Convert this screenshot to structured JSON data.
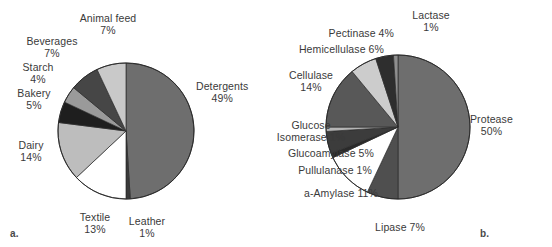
{
  "figure": {
    "background_color": "#ffffff",
    "text_color": "#3a3a3a",
    "panel_a_tag": "a.",
    "panel_b_tag": "b."
  },
  "chart_data": [
    {
      "type": "pie",
      "id": "industrial-enzyme-markets",
      "title": "",
      "panel_label": "a.",
      "units": "percent",
      "start_angle_deg": 0,
      "direction": "clockwise",
      "categories": [
        "Detergents",
        "Leather",
        "Textile",
        "Dairy",
        "Bakery",
        "Starch",
        "Beverages",
        "Animal feed"
      ],
      "values": [
        49,
        1,
        13,
        14,
        5,
        4,
        7,
        7
      ],
      "labels": [
        {
          "name": "Detergents",
          "pct": "49%",
          "value": 49,
          "fill": "#6e6e6e"
        },
        {
          "name": "Leather",
          "pct": "1%",
          "value": 1,
          "fill": "#3a3a3a"
        },
        {
          "name": "Textile",
          "pct": "13%",
          "value": 13,
          "fill": "#ffffff"
        },
        {
          "name": "Dairy",
          "pct": "14%",
          "value": 14,
          "fill": "#bdbdbd"
        },
        {
          "name": "Bakery",
          "pct": "5%",
          "value": 5,
          "fill": "#1e1e1e"
        },
        {
          "name": "Starch",
          "pct": "4%",
          "value": 4,
          "fill": "#9a9a9a"
        },
        {
          "name": "Beverages",
          "pct": "7%",
          "value": 7,
          "fill": "#464646"
        },
        {
          "name": "Animal feed",
          "pct": "7%",
          "value": 7,
          "fill": "#c9c9c9"
        }
      ],
      "legend": "none",
      "grid": false
    },
    {
      "type": "pie",
      "id": "industrial-enzyme-types",
      "title": "",
      "panel_label": "b.",
      "units": "percent",
      "start_angle_deg": 0,
      "direction": "clockwise",
      "categories": [
        "Protease",
        "Lipase",
        "a-Amylase",
        "Pullulanase",
        "Glucoamylase",
        "Glucose Isomerase",
        "Cellulase",
        "Hemicellulase",
        "Pectinase",
        "Lactase"
      ],
      "values": [
        50,
        7,
        11,
        1,
        5,
        1,
        14,
        6,
        4,
        1
      ],
      "labels": [
        {
          "name": "Protease",
          "pct": "50%",
          "value": 50,
          "fill": "#6e6e6e"
        },
        {
          "name": "Lipase",
          "pct": "7%",
          "value": 7,
          "fill": "#4f4f4f"
        },
        {
          "name": "a-Amylase",
          "pct": "11%",
          "value": 11,
          "fill": "#ffffff"
        },
        {
          "name": "Pullulanase",
          "pct": "1%",
          "value": 1,
          "fill": "#2a2a2a"
        },
        {
          "name": "Glucoamylase",
          "pct": "5%",
          "value": 5,
          "fill": "#3c3c3c"
        },
        {
          "name": "Glucose Isomerase",
          "pct": "1%",
          "value": 1,
          "fill": "#b5b5b5"
        },
        {
          "name": "Cellulase",
          "pct": "14%",
          "value": 14,
          "fill": "#585858"
        },
        {
          "name": "Hemicellulase",
          "pct": "6%",
          "value": 6,
          "fill": "#cccccc"
        },
        {
          "name": "Pectinase",
          "pct": "4%",
          "value": 4,
          "fill": "#2e2e2e"
        },
        {
          "name": "Lactase",
          "pct": "1%",
          "value": 1,
          "fill": "#8f8f8f"
        }
      ],
      "legend": "none",
      "grid": false
    }
  ],
  "chart_a_labels": {
    "detergents_name": "Detergents",
    "detergents_pct": "49%",
    "leather_name": "Leather",
    "leather_pct": "1%",
    "textile_name": "Textile",
    "textile_pct": "13%",
    "dairy_name": "Dairy",
    "dairy_pct": "14%",
    "bakery_name": "Bakery",
    "bakery_pct": "5%",
    "starch_name": "Starch",
    "starch_pct": "4%",
    "beverages_name": "Beverages",
    "beverages_pct": "7%",
    "animalfeed_name": "Animal feed",
    "animalfeed_pct": "7%"
  },
  "chart_b_labels": {
    "protease_name": "Protease",
    "protease_pct": "50%",
    "lipase_text": "Lipase 7%",
    "amylase_text": "a-Amylase 11%",
    "pullulanase_text": "Pullulanase 1%",
    "glucoamylase_text": "Glucoamylase 5%",
    "glucose_name": "Glucose",
    "glucose_pct": "Isomerase 1%",
    "cellulase_name": "Cellulase",
    "cellulase_pct": "14%",
    "hemicellulase_text": "Hemicellulase 6%",
    "pectinase_text": "Pectinase 4%",
    "lactase_name": "Lactase",
    "lactase_pct": "1%"
  }
}
